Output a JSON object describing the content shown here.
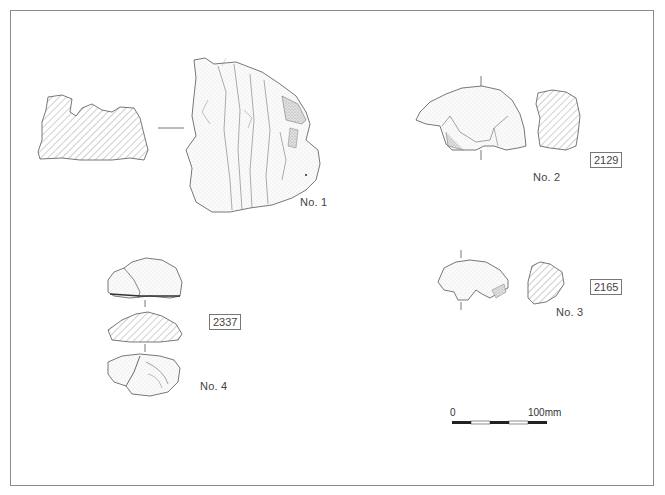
{
  "plate": {
    "artifacts": [
      {
        "no": "No. 1",
        "id": null
      },
      {
        "no": "No. 2",
        "id": "2129"
      },
      {
        "no": "No. 3",
        "id": "2165"
      },
      {
        "no": "No. 4",
        "id": "2337"
      }
    ],
    "scale_bar": {
      "start_label": "0",
      "end_label": "100mm",
      "segments": 5
    },
    "colors": {
      "line": "#555555",
      "hatch": "#888888",
      "stipple": "#b0b0b0",
      "frame": "#8a8a8a"
    }
  }
}
